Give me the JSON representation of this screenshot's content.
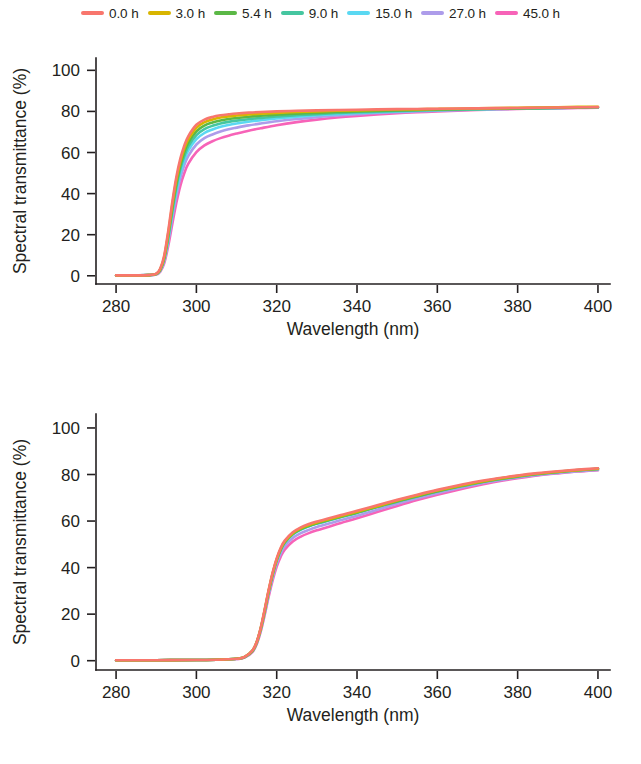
{
  "legend": {
    "position": "top-center",
    "entries": [
      {
        "label": "0.0 h",
        "color": "#f8766d"
      },
      {
        "label": "3.0 h",
        "color": "#d8b500"
      },
      {
        "label": "5.4 h",
        "color": "#5bb846"
      },
      {
        "label": "9.0 h",
        "color": "#45c6a0"
      },
      {
        "label": "15.0 h",
        "color": "#5ad8f2"
      },
      {
        "label": "27.0 h",
        "color": "#ad9cea"
      },
      {
        "label": "45.0 h",
        "color": "#f763b8"
      }
    ]
  },
  "chart_data": [
    {
      "type": "line",
      "panel": "top",
      "title": "",
      "xlabel": "Wavelength (nm)",
      "ylabel": "Spectral transmittance (%)",
      "xlim": [
        275,
        403
      ],
      "ylim": [
        -4,
        106
      ],
      "xticks": [
        280,
        300,
        320,
        340,
        360,
        380,
        400
      ],
      "yticks": [
        0,
        20,
        40,
        60,
        80,
        100
      ],
      "grid": false,
      "x": [
        280,
        284,
        288,
        290,
        291,
        292,
        293,
        294,
        295,
        296,
        297,
        298,
        300,
        302,
        304,
        306,
        308,
        310,
        313,
        316,
        320,
        325,
        330,
        335,
        340,
        345,
        350,
        355,
        360,
        365,
        370,
        375,
        380,
        385,
        390,
        395,
        400
      ],
      "series": [
        {
          "name": "0.0 h",
          "color": "#f8766d",
          "values": [
            0.2,
            0.2,
            0.3,
            1.0,
            3.5,
            10.0,
            22.0,
            36.0,
            48.0,
            57.0,
            63.5,
            68.0,
            73.5,
            76.0,
            77.3,
            78.1,
            78.6,
            79.0,
            79.4,
            79.7,
            80.0,
            80.3,
            80.5,
            80.7,
            80.8,
            81.0,
            81.1,
            81.2,
            81.3,
            81.4,
            81.5,
            81.6,
            81.7,
            81.8,
            81.9,
            82.0,
            82.1
          ]
        },
        {
          "name": "3.0 h",
          "color": "#d8b500",
          "values": [
            0.2,
            0.2,
            0.3,
            0.9,
            3.2,
            9.3,
            20.8,
            34.5,
            46.5,
            55.5,
            62.0,
            66.5,
            72.0,
            74.7,
            76.1,
            77.0,
            77.6,
            78.0,
            78.5,
            78.9,
            79.3,
            79.7,
            80.0,
            80.3,
            80.5,
            80.7,
            80.9,
            81.0,
            81.2,
            81.3,
            81.5,
            81.6,
            81.8,
            81.9,
            82.0,
            82.2,
            82.3
          ]
        },
        {
          "name": "5.4 h",
          "color": "#5bb846",
          "values": [
            0.2,
            0.2,
            0.3,
            0.9,
            3.0,
            8.8,
            19.8,
            33.0,
            44.8,
            53.8,
            60.2,
            64.8,
            70.3,
            73.1,
            74.6,
            75.6,
            76.3,
            76.8,
            77.4,
            77.9,
            78.4,
            78.9,
            79.3,
            79.7,
            80.0,
            80.3,
            80.5,
            80.7,
            80.9,
            81.1,
            81.2,
            81.4,
            81.5,
            81.6,
            81.8,
            81.9,
            82.0
          ]
        },
        {
          "name": "9.0 h",
          "color": "#45c6a0",
          "values": [
            0.2,
            0.2,
            0.3,
            0.8,
            2.8,
            8.3,
            18.8,
            31.5,
            43.0,
            52.0,
            58.4,
            63.0,
            68.5,
            71.4,
            73.0,
            74.1,
            74.9,
            75.5,
            76.2,
            76.8,
            77.5,
            78.1,
            78.7,
            79.2,
            79.6,
            79.9,
            80.2,
            80.5,
            80.7,
            80.9,
            81.1,
            81.3,
            81.4,
            81.6,
            81.7,
            81.9,
            82.0
          ]
        },
        {
          "name": "15.0 h",
          "color": "#5ad8f2",
          "values": [
            0.2,
            0.2,
            0.3,
            0.8,
            2.6,
            7.8,
            17.8,
            30.0,
            41.2,
            50.0,
            56.4,
            61.0,
            66.5,
            69.5,
            71.2,
            72.5,
            73.4,
            74.1,
            75.0,
            75.7,
            76.6,
            77.4,
            78.1,
            78.7,
            79.2,
            79.6,
            80.0,
            80.3,
            80.6,
            80.8,
            81.0,
            81.2,
            81.4,
            81.6,
            81.7,
            81.9,
            82.0
          ]
        },
        {
          "name": "27.0 h",
          "color": "#ad9cea",
          "values": [
            0.2,
            0.2,
            0.3,
            0.7,
            2.4,
            7.2,
            16.6,
            28.2,
            39.0,
            47.6,
            53.9,
            58.4,
            63.9,
            67.0,
            68.8,
            70.2,
            71.3,
            72.1,
            73.2,
            74.1,
            75.2,
            76.3,
            77.2,
            78.0,
            78.6,
            79.2,
            79.6,
            80.0,
            80.3,
            80.6,
            80.9,
            81.1,
            81.3,
            81.5,
            81.6,
            81.8,
            81.9
          ]
        },
        {
          "name": "45.0 h",
          "color": "#f763b8",
          "values": [
            0.2,
            0.2,
            0.3,
            0.6,
            2.0,
            6.2,
            14.6,
            25.2,
            35.4,
            43.8,
            50.0,
            54.6,
            60.2,
            63.5,
            65.5,
            67.0,
            68.2,
            69.2,
            70.6,
            71.8,
            73.3,
            74.8,
            76.0,
            77.0,
            77.8,
            78.5,
            79.1,
            79.6,
            80.0,
            80.4,
            80.7,
            81.0,
            81.2,
            81.4,
            81.5,
            81.7,
            81.8
          ]
        }
      ]
    },
    {
      "type": "line",
      "panel": "bottom",
      "title": "",
      "xlabel": "Wavelength (nm)",
      "ylabel": "Spectral transmittance (%)",
      "xlim": [
        275,
        403
      ],
      "ylim": [
        -4,
        106
      ],
      "xticks": [
        280,
        300,
        320,
        340,
        360,
        380,
        400
      ],
      "yticks": [
        0,
        20,
        40,
        60,
        80,
        100
      ],
      "grid": false,
      "x": [
        280,
        290,
        300,
        305,
        310,
        312,
        314,
        315,
        316,
        317,
        318,
        319,
        320,
        321,
        322,
        324,
        326,
        328,
        330,
        333,
        336,
        340,
        345,
        350,
        355,
        360,
        365,
        370,
        375,
        380,
        385,
        390,
        395,
        400
      ],
      "series": [
        {
          "name": "0.0 h",
          "color": "#f8766d",
          "values": [
            0.2,
            0.2,
            0.3,
            0.4,
            0.8,
            1.6,
            4.5,
            8.0,
            14.0,
            22.0,
            30.5,
            38.0,
            44.0,
            48.5,
            51.6,
            55.2,
            57.3,
            58.7,
            59.8,
            61.2,
            62.6,
            64.4,
            66.8,
            69.1,
            71.3,
            73.4,
            75.3,
            77.0,
            78.4,
            79.6,
            80.6,
            81.4,
            82.1,
            82.7
          ]
        },
        {
          "name": "3.0 h",
          "color": "#d8b500",
          "values": [
            0.2,
            0.2,
            0.3,
            0.4,
            0.8,
            1.6,
            4.4,
            7.9,
            13.8,
            21.7,
            30.1,
            37.6,
            43.6,
            48.1,
            51.2,
            54.8,
            56.9,
            58.3,
            59.4,
            60.8,
            62.2,
            64.0,
            66.4,
            68.8,
            71.0,
            73.1,
            75.0,
            76.7,
            78.2,
            79.4,
            80.4,
            81.2,
            81.9,
            82.5
          ]
        },
        {
          "name": "5.4 h",
          "color": "#5bb846",
          "values": [
            0.2,
            0.2,
            0.3,
            0.4,
            0.8,
            1.5,
            4.3,
            7.8,
            13.6,
            21.4,
            29.8,
            37.3,
            43.3,
            47.8,
            50.9,
            54.5,
            56.6,
            58.0,
            59.1,
            60.5,
            61.9,
            63.7,
            66.1,
            68.5,
            70.7,
            72.8,
            74.8,
            76.5,
            78.0,
            79.2,
            80.2,
            81.1,
            81.8,
            82.4
          ]
        },
        {
          "name": "9.0 h",
          "color": "#45c6a0",
          "values": [
            0.2,
            0.2,
            0.3,
            0.4,
            0.8,
            1.5,
            4.3,
            7.7,
            13.5,
            21.2,
            29.6,
            37.1,
            43.1,
            47.6,
            50.7,
            54.3,
            56.4,
            57.8,
            58.9,
            60.3,
            61.7,
            63.5,
            66.0,
            68.3,
            70.6,
            72.7,
            74.6,
            76.4,
            77.9,
            79.1,
            80.2,
            81.0,
            81.8,
            82.4
          ]
        },
        {
          "name": "15.0 h",
          "color": "#5ad8f2",
          "values": [
            0.2,
            0.2,
            0.3,
            0.4,
            0.8,
            1.5,
            4.2,
            7.6,
            13.4,
            21.1,
            29.4,
            36.9,
            42.9,
            47.4,
            50.6,
            54.2,
            56.3,
            57.8,
            58.9,
            60.3,
            61.8,
            63.6,
            66.1,
            68.5,
            70.8,
            72.9,
            74.9,
            76.6,
            78.1,
            79.3,
            80.3,
            81.2,
            81.9,
            82.5
          ]
        },
        {
          "name": "27.0 h",
          "color": "#ad9cea",
          "values": [
            0.2,
            0.2,
            0.3,
            0.4,
            0.7,
            1.4,
            4.0,
            7.3,
            12.9,
            20.4,
            28.5,
            35.8,
            41.7,
            46.1,
            49.2,
            52.7,
            54.8,
            56.2,
            57.4,
            58.9,
            60.4,
            62.3,
            64.9,
            67.4,
            69.8,
            72.0,
            74.0,
            75.8,
            77.4,
            78.7,
            79.8,
            80.7,
            81.4,
            82.0
          ]
        },
        {
          "name": "45.0 h",
          "color": "#f763b8",
          "values": [
            0.2,
            0.2,
            0.3,
            0.4,
            0.7,
            1.3,
            3.8,
            7.0,
            12.4,
            19.6,
            27.5,
            34.6,
            40.4,
            44.7,
            47.7,
            51.2,
            53.3,
            54.8,
            56.0,
            57.6,
            59.2,
            61.2,
            63.9,
            66.5,
            69.0,
            71.3,
            73.4,
            75.3,
            77.0,
            78.4,
            79.6,
            80.5,
            81.3,
            81.9
          ]
        }
      ]
    }
  ]
}
